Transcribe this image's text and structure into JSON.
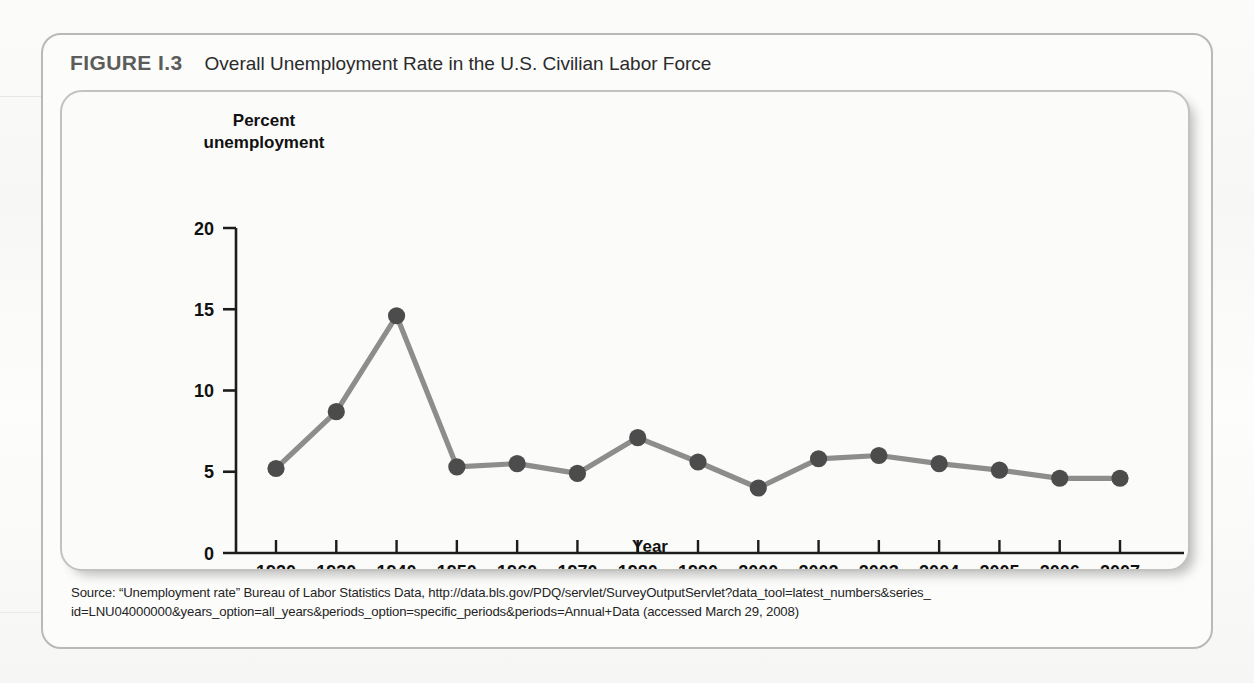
{
  "figure": {
    "label": "FIGURE I.3",
    "title": "Overall Unemployment Rate in the U.S. Civilian Labor Force",
    "source_line_1": "Source: “Unemployment rate” Bureau of Labor Statistics Data, http://data.bls.gov/PDQ/servlet/SurveyOutputServlet?data_tool=latest_numbers&series_",
    "source_line_2": "id=LNU04000000&years_option=all_years&periods_option=specific_periods&periods=Annual+Data (accessed March 29, 2008)"
  },
  "colors": {
    "line": "#8d8d8b",
    "marker": "#4c4c4c",
    "axis": "#1c1c1c",
    "panel_bg": "#fbfbfa",
    "frame_border": "#b9b9b6"
  },
  "chart_data": {
    "type": "line",
    "title": "Overall Unemployment Rate in the U.S. Civilian Labor Force",
    "xlabel": "Year",
    "ylabel": "Percent unemployment",
    "ylabel_line_1": "Percent",
    "ylabel_line_2": "unemployment",
    "categories": [
      "1920",
      "1930",
      "1940",
      "1950",
      "1960",
      "1970",
      "1980",
      "1990",
      "2000",
      "2002",
      "2003",
      "2004",
      "2005",
      "2006",
      "2007"
    ],
    "values": [
      5.2,
      8.7,
      14.6,
      5.3,
      5.5,
      4.9,
      7.1,
      5.6,
      4.0,
      5.8,
      6.0,
      5.5,
      5.1,
      4.6,
      4.6
    ],
    "ylim": [
      0,
      20
    ],
    "yticks": [
      0,
      5,
      10,
      15,
      20
    ],
    "ytick_labels": [
      "0",
      "5",
      "10",
      "15",
      "20"
    ],
    "grid": false,
    "legend": false,
    "marker": "circle"
  }
}
